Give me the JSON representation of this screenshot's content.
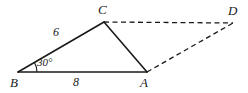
{
  "figure": {
    "background_color": "#ffffff",
    "stroke_color": "#1a1a1a",
    "vertices": [
      {
        "name": "B",
        "label": "B",
        "x": 18,
        "y": 72,
        "label_x": 10,
        "label_y": 76
      },
      {
        "name": "C",
        "label": "C",
        "x": 104,
        "y": 22,
        "label_x": 98,
        "label_y": 3
      },
      {
        "name": "A",
        "label": "A",
        "x": 147,
        "y": 72,
        "label_x": 140,
        "label_y": 76
      },
      {
        "name": "D",
        "label": "D",
        "x": 233,
        "y": 23,
        "label_x": 228,
        "label_y": 4
      }
    ],
    "solid_edges": [
      {
        "name": "edge-bc",
        "from": "B",
        "to": "C",
        "x1": 18,
        "y1": 72,
        "x2": 104,
        "y2": 22
      },
      {
        "name": "edge-ca",
        "from": "C",
        "to": "A",
        "x1": 104,
        "y1": 22,
        "x2": 147,
        "y2": 72
      },
      {
        "name": "edge-ba",
        "from": "B",
        "to": "A",
        "x1": 18,
        "y1": 72,
        "x2": 147,
        "y2": 72
      }
    ],
    "dashed_edges": [
      {
        "name": "edge-cd",
        "from": "C",
        "to": "D",
        "x1": 104,
        "y1": 22,
        "x2": 233,
        "y2": 23
      },
      {
        "name": "edge-ad",
        "from": "A",
        "to": "D",
        "x1": 147,
        "y1": 72,
        "x2": 233,
        "y2": 23
      }
    ],
    "side_labels": [
      {
        "name": "side-length-bc",
        "text": "6",
        "x": 53,
        "y": 26
      },
      {
        "name": "side-length-ba",
        "text": "8",
        "x": 73,
        "y": 76
      }
    ],
    "angle_labels": [
      {
        "name": "angle-b",
        "text": "30°",
        "x": 37,
        "y": 57
      }
    ],
    "angle_arc": {
      "name": "angle-arc-b",
      "vertex": "B",
      "radius": 19,
      "path": "M 37 72 A 19 19 0 0 0 34.45 62.5"
    }
  }
}
